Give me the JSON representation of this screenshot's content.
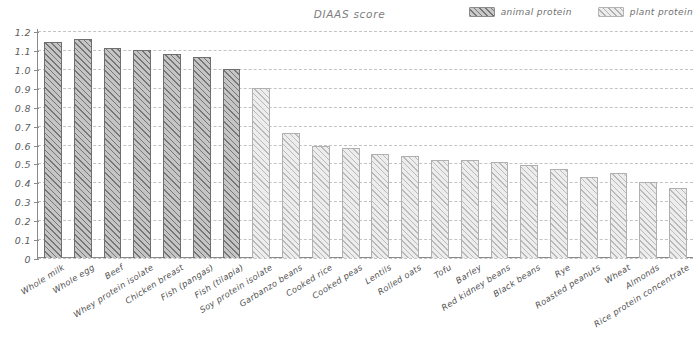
{
  "top_caption": "(clipped text)",
  "header": {
    "title": "DIAAS score"
  },
  "legend": {
    "position": "top-right",
    "items": [
      {
        "label": "animal protein",
        "key": "animal",
        "color": "#c5c5c5"
      },
      {
        "label": "plant protein",
        "key": "plant",
        "color": "#ededed"
      }
    ]
  },
  "colors": {
    "animal": "#c5c5c5",
    "plant": "#ededed",
    "axis": "#8a8a8a",
    "grid": "#c3c3c3",
    "text": "#4f4f4f"
  },
  "axes": {
    "y_ticks": [
      "0",
      "0.1",
      "0.2",
      "0.3",
      "0.4",
      "0.5",
      "0.6",
      "0.7",
      "0.8",
      "0.9",
      "1.0",
      "1.1",
      "1.2"
    ],
    "y_tick_values": [
      0,
      0.1,
      0.2,
      0.3,
      0.4,
      0.5,
      0.6,
      0.7,
      0.8,
      0.9,
      1.0,
      1.1,
      1.2
    ],
    "ylim": [
      0,
      1.2
    ],
    "grid": true
  },
  "chart_data": {
    "type": "bar",
    "title": "DIAAS score",
    "xlabel": "",
    "ylabel": "",
    "ylim": [
      0,
      1.2
    ],
    "grid": true,
    "legend_position": "top-right",
    "categories": [
      "Whole milk",
      "Whole egg",
      "Beef",
      "Whey protein isolate",
      "Chicken breast",
      "Fish (pangas)",
      "Fish (tilapia)",
      "Soy protein isolate",
      "Garbanzo beans",
      "Cooked rice",
      "Cooked peas",
      "Lentils",
      "Rolled oats",
      "Tofu",
      "Barley",
      "Red kidney beans",
      "Black beans",
      "Rye",
      "Roasted peanuts",
      "Wheat",
      "Almonds",
      "Rice protein concentrate"
    ],
    "values": [
      1.14,
      1.16,
      1.11,
      1.1,
      1.08,
      1.06,
      1.0,
      0.9,
      0.66,
      0.59,
      0.58,
      0.55,
      0.54,
      0.52,
      0.52,
      0.51,
      0.49,
      0.47,
      0.43,
      0.45,
      0.4,
      0.37
    ],
    "groups": [
      "animal",
      "animal",
      "animal",
      "animal",
      "animal",
      "animal",
      "animal",
      "plant",
      "plant",
      "plant",
      "plant",
      "plant",
      "plant",
      "plant",
      "plant",
      "plant",
      "plant",
      "plant",
      "plant",
      "plant",
      "plant",
      "plant"
    ],
    "series": [
      {
        "name": "animal protein",
        "key": "animal"
      },
      {
        "name": "plant protein",
        "key": "plant"
      }
    ]
  }
}
